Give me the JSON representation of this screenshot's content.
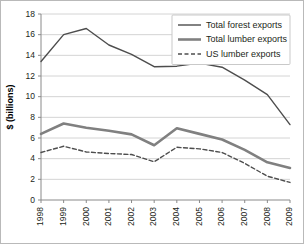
{
  "chart_data": {
    "type": "line",
    "title": "",
    "xlabel": "",
    "ylabel": "$ (billions)",
    "categories": [
      "1998",
      "1999",
      "2000",
      "2001",
      "2002",
      "2003",
      "2004",
      "2005",
      "2006",
      "2007",
      "2008",
      "2009"
    ],
    "ylim": [
      0,
      18
    ],
    "ytick_step": 2,
    "yticks": [
      "0",
      "2",
      "4",
      "6",
      "8",
      "10",
      "12",
      "14",
      "16",
      "18"
    ],
    "grid": true,
    "legend_position": "top-right",
    "series": [
      {
        "name": "Total forest exports",
        "style": "solid-thin",
        "color": "#4d4d4d",
        "values": [
          13.4,
          16.0,
          16.6,
          15.0,
          14.1,
          12.9,
          12.95,
          13.25,
          12.85,
          11.6,
          10.2,
          7.3
        ]
      },
      {
        "name": "Total lumber exports",
        "style": "solid-thick",
        "color": "#808080",
        "values": [
          6.4,
          7.4,
          7.0,
          6.7,
          6.35,
          5.3,
          6.95,
          6.4,
          5.85,
          4.85,
          3.65,
          3.1
        ]
      },
      {
        "name": "US lumber exports",
        "style": "dashed",
        "color": "#4d4d4d",
        "values": [
          4.6,
          5.2,
          4.65,
          4.5,
          4.4,
          3.7,
          5.1,
          4.95,
          4.6,
          3.55,
          2.3,
          1.7
        ]
      }
    ]
  },
  "legend": {
    "items": [
      {
        "label": "Total forest exports"
      },
      {
        "label": "Total lumber exports"
      },
      {
        "label": "US lumber exports"
      }
    ]
  }
}
